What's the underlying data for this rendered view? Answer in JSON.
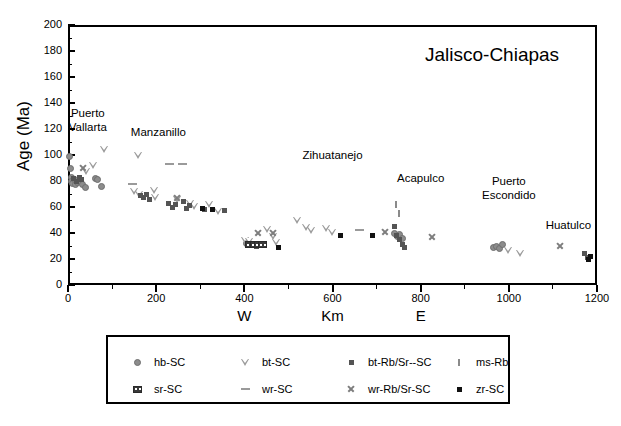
{
  "chart_data": {
    "type": "scatter",
    "title": "Jalisco-Chiapas",
    "xlabel": "Km",
    "ylabel": "Age (Ma)",
    "xlim": [
      0,
      1200
    ],
    "ylim": [
      0,
      200
    ],
    "xticks": [
      0,
      200,
      400,
      600,
      800,
      1000,
      1200
    ],
    "yticks": [
      0,
      20,
      40,
      60,
      80,
      100,
      120,
      140,
      160,
      180,
      200
    ],
    "xtick_labels": [
      "0",
      "200",
      "400",
      "600",
      "800",
      "1000",
      "1200"
    ],
    "ytick_labels": [
      "0",
      "20",
      "40",
      "60",
      "80",
      "100",
      "120",
      "140",
      "160",
      "180",
      "200"
    ],
    "x_minor_interval": 100,
    "y_minor_interval": 10,
    "grid": false,
    "legend_position": "below-plot",
    "direction_labels": [
      {
        "text": "W",
        "x": 400
      },
      {
        "text": "Km",
        "x": 600
      },
      {
        "text": "E",
        "x": 800
      }
    ],
    "annotations": [
      {
        "text": "Puerto\nVallarta",
        "x": 45,
        "y": 132
      },
      {
        "text": "Manzanillo",
        "x": 205,
        "y": 118
      },
      {
        "text": "Zihuatanejo",
        "x": 600,
        "y": 100
      },
      {
        "text": "Acapulco",
        "x": 800,
        "y": 82
      },
      {
        "text": "Puerto\nEscondido",
        "x": 1000,
        "y": 80
      },
      {
        "text": "Huatulco",
        "x": 1135,
        "y": 46
      }
    ],
    "series": [
      {
        "name": "hb-SC",
        "marker": "filled-grey-circle",
        "marker_class": "m-hb",
        "points": [
          [
            4,
            99
          ],
          [
            5,
            90
          ],
          [
            7,
            83
          ],
          [
            9,
            80
          ],
          [
            11,
            78
          ],
          [
            14,
            81
          ],
          [
            18,
            77
          ],
          [
            22,
            79
          ],
          [
            27,
            80
          ],
          [
            33,
            77
          ],
          [
            40,
            75
          ],
          [
            62,
            82
          ],
          [
            68,
            81
          ],
          [
            75,
            76
          ],
          [
            404,
            32
          ],
          [
            740,
            40
          ],
          [
            748,
            37
          ],
          [
            752,
            39
          ],
          [
            758,
            36
          ],
          [
            965,
            29
          ],
          [
            972,
            30
          ],
          [
            978,
            28
          ],
          [
            985,
            31
          ]
        ]
      },
      {
        "name": "bt-SC",
        "marker": "open-down-triangle",
        "marker_class": "m-bt",
        "points": [
          [
            83,
            105
          ],
          [
            58,
            92
          ],
          [
            41,
            88
          ],
          [
            160,
            100
          ],
          [
            151,
            72
          ],
          [
            163,
            70
          ],
          [
            196,
            73
          ],
          [
            199,
            68
          ],
          [
            248,
            66
          ],
          [
            279,
            63
          ],
          [
            286,
            61
          ],
          [
            320,
            62
          ],
          [
            341,
            57
          ],
          [
            402,
            35
          ],
          [
            412,
            34
          ],
          [
            452,
            43
          ],
          [
            466,
            38
          ],
          [
            474,
            33
          ],
          [
            520,
            50
          ],
          [
            540,
            45
          ],
          [
            553,
            42
          ],
          [
            586,
            44
          ],
          [
            600,
            41
          ],
          [
            999,
            27
          ],
          [
            1027,
            25
          ]
        ]
      },
      {
        "name": "bt-Rb/Sr--SC",
        "marker": "small-dark-square",
        "marker_class": "m-btrb",
        "points": [
          [
            13,
            82
          ],
          [
            20,
            80
          ],
          [
            26,
            83
          ],
          [
            31,
            81
          ],
          [
            165,
            69
          ],
          [
            172,
            67
          ],
          [
            178,
            70
          ],
          [
            184,
            66
          ],
          [
            228,
            63
          ],
          [
            236,
            60
          ],
          [
            244,
            62
          ],
          [
            262,
            64
          ],
          [
            268,
            59
          ],
          [
            275,
            61
          ],
          [
            310,
            58
          ],
          [
            356,
            57
          ],
          [
            418,
            31
          ],
          [
            428,
            30
          ],
          [
            434,
            32
          ],
          [
            740,
            45
          ],
          [
            746,
            38
          ],
          [
            752,
            35
          ],
          [
            758,
            31
          ],
          [
            764,
            29
          ],
          [
            1172,
            24
          ],
          [
            1178,
            21
          ]
        ]
      },
      {
        "name": "ms-Rb/Sr-SC",
        "marker": "thin-vertical-tick",
        "marker_class": "m-ms",
        "points": [
          [
            744,
            62
          ],
          [
            750,
            55
          ]
        ]
      },
      {
        "name": "sr-SC",
        "marker": "dark-rect-grid",
        "marker_class": "m-sr",
        "points": [
          [
            412,
            31
          ],
          [
            422,
            31
          ],
          [
            432,
            31
          ],
          [
            442,
            31
          ]
        ]
      },
      {
        "name": "wr-SC",
        "marker": "horizontal-dash",
        "marker_class": "m-wr",
        "points": [
          [
            231,
            93
          ],
          [
            259,
            93
          ],
          [
            146,
            78
          ],
          [
            661,
            42
          ]
        ]
      },
      {
        "name": "wr-Rb/Sr-SC",
        "marker": "x-cross",
        "marker_class": "m-wrrb",
        "points": [
          [
            35,
            90
          ],
          [
            247,
            67
          ],
          [
            432,
            40
          ],
          [
            466,
            40
          ],
          [
            718,
            41
          ],
          [
            826,
            37
          ],
          [
            1115,
            30
          ]
        ]
      },
      {
        "name": "zr-SC",
        "marker": "small-black-square",
        "marker_class": "m-zr",
        "points": [
          [
            304,
            59
          ],
          [
            328,
            58
          ],
          [
            478,
            29
          ],
          [
            618,
            38
          ],
          [
            690,
            38
          ],
          [
            1180,
            20
          ],
          [
            1186,
            22
          ]
        ]
      }
    ],
    "legend_entries": [
      {
        "label": "hb-SC",
        "marker_class": "m-hb",
        "col": 0,
        "row": 0
      },
      {
        "label": "bt-SC",
        "marker_class": "m-bt",
        "col": 1,
        "row": 0
      },
      {
        "label": "bt-Rb/Sr--SC",
        "marker_class": "m-btrb",
        "col": 2,
        "row": 0
      },
      {
        "label": "ms-Rb/Sr-SC",
        "marker_class": "m-ms",
        "col": 3,
        "row": 0
      },
      {
        "label": "sr-SC",
        "marker_class": "m-sr",
        "col": 0,
        "row": 1
      },
      {
        "label": "wr-SC",
        "marker_class": "m-wr",
        "col": 1,
        "row": 1
      },
      {
        "label": "wr-Rb/Sr-SC",
        "marker_class": "m-wrrb",
        "col": 2,
        "row": 1
      },
      {
        "label": "zr-SC",
        "marker_class": "m-zr",
        "col": 3,
        "row": 1
      }
    ]
  }
}
